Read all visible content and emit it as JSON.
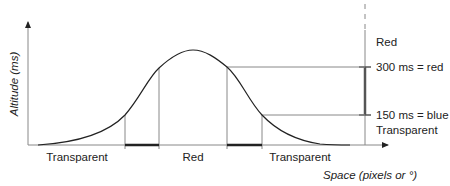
{
  "figure": {
    "y_axis_label": "Altitude (ms)",
    "x_axis_label": "Space (pixels or °)",
    "bottom_regions": [
      {
        "label": "Transparent"
      },
      {
        "label": "Red"
      },
      {
        "label": "Transparent"
      }
    ],
    "right_scale": {
      "top_label": "Red",
      "upper_threshold_label": "300 ms = red",
      "lower_threshold_label": "150 ms = blue",
      "bottom_label": "Transparent"
    }
  },
  "colors": {
    "line": "#222222",
    "guide": "#888888",
    "background": "#ffffff"
  }
}
